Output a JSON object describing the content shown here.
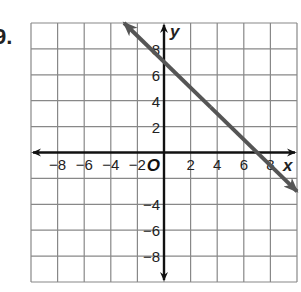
{
  "problem": {
    "number_label": "9."
  },
  "chart_data": {
    "type": "line",
    "title": "",
    "xlabel": "x",
    "ylabel": "y",
    "origin_label": "O",
    "xlim": [
      -10,
      10
    ],
    "ylim": [
      -10,
      10
    ],
    "grid": true,
    "grid_step": 2,
    "x_ticks": [
      -8,
      -6,
      -4,
      -2,
      2,
      4,
      6,
      8
    ],
    "y_ticks": [
      8,
      6,
      4,
      2,
      -4,
      -6,
      -8
    ],
    "x_tick_labels": [
      "−8",
      "−6",
      "−4",
      "−2",
      "2",
      "4",
      "6",
      "8"
    ],
    "y_tick_labels": [
      "8",
      "6",
      "4",
      "2",
      "−4",
      "−6",
      "−8"
    ],
    "series": [
      {
        "name": "line",
        "equation": "y = -x + 7",
        "slope": -1,
        "y_intercept": 7,
        "x_intercept": 7,
        "x": [
          -3,
          0,
          7,
          10
        ],
        "y": [
          10,
          7,
          0,
          -3
        ],
        "arrows": "both",
        "color": "#555555"
      }
    ],
    "legend": null
  },
  "colors": {
    "grid": "#888888",
    "axis": "#111111",
    "line": "#555555"
  }
}
